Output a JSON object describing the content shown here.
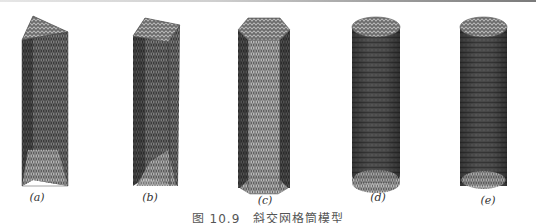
{
  "figure": {
    "caption": "图 10.9　斜交网格筒模型",
    "panels": [
      {
        "id": "a",
        "label": "(a)",
        "shape": "triangular prism",
        "label_x": 37,
        "label_y": 191
      },
      {
        "id": "b",
        "label": "(b)",
        "shape": "square prism",
        "label_x": 150,
        "label_y": 191
      },
      {
        "id": "c",
        "label": "(c)",
        "shape": "octagonal prism",
        "label_x": 265,
        "label_y": 194
      },
      {
        "id": "d",
        "label": "(d)",
        "shape": "polygonal (many-sided) prism",
        "label_x": 378,
        "label_y": 191
      },
      {
        "id": "e",
        "label": "(e)",
        "shape": "cylinder",
        "label_x": 488,
        "label_y": 194
      }
    ]
  },
  "colors": {
    "lattice_dark": "#3a3a3a",
    "lattice_mid": "#6a6a6a",
    "lattice_light": "#9a9a9a",
    "label": "#333333"
  }
}
